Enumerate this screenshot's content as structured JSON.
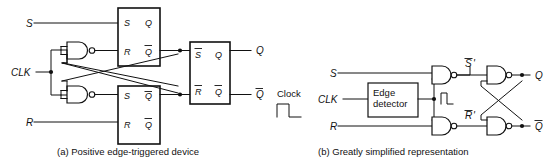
{
  "figure": {
    "panels": [
      {
        "id": "a",
        "caption": "(a)  Positive edge-triggered device",
        "inputs": [
          {
            "name": "input-S",
            "label": "S"
          },
          {
            "name": "input-CLK",
            "label": "CLK"
          },
          {
            "name": "input-R",
            "label": "R"
          }
        ],
        "outputs": [
          {
            "name": "output-Q",
            "label": "Q"
          },
          {
            "name": "output-Qbar",
            "label": "Q",
            "overbar": true
          }
        ],
        "latches": [
          {
            "name": "latch-top-left",
            "pins": {
              "s": "S",
              "q": "Q",
              "r": "R",
              "qbar": "Q"
            }
          },
          {
            "name": "latch-bottom-left",
            "pins": {
              "s": "S",
              "q": "Q",
              "r": "R",
              "qbar": "Q"
            }
          },
          {
            "name": "latch-right",
            "pins": {
              "s": "S",
              "q": "Q",
              "r": "R",
              "qbar": "Q"
            }
          }
        ],
        "gates": [
          {
            "name": "nand-gate-top",
            "type": "NAND",
            "inputs": 2
          },
          {
            "name": "nand-gate-bottom",
            "type": "NAND",
            "inputs": 2
          }
        ]
      },
      {
        "id": "b",
        "caption": "(b) Greatly simplified representation",
        "clock_legend": "Clock",
        "inputs": [
          {
            "name": "input-S",
            "label": "S"
          },
          {
            "name": "input-CLK",
            "label": "CLK"
          },
          {
            "name": "input-R",
            "label": "R"
          }
        ],
        "block": {
          "name": "edge-detector-block",
          "line1": "Edge",
          "line2": "detector"
        },
        "internal_signals": [
          {
            "name": "signal-s-prime",
            "label": "S",
            "overbar": true,
            "prime": "'"
          },
          {
            "name": "signal-r-prime",
            "label": "R",
            "overbar": true,
            "prime": "'"
          }
        ],
        "outputs": [
          {
            "name": "output-Q",
            "label": "Q"
          },
          {
            "name": "output-Qbar",
            "label": "Q",
            "overbar": true
          }
        ],
        "gates": [
          {
            "name": "nand-gate-set",
            "type": "NAND",
            "inputs": 2
          },
          {
            "name": "nand-gate-reset",
            "type": "NAND",
            "inputs": 2
          },
          {
            "name": "nand-gate-cross-top",
            "type": "NAND",
            "inputs": 2
          },
          {
            "name": "nand-gate-cross-bottom",
            "type": "NAND",
            "inputs": 2
          }
        ]
      }
    ],
    "colors": {
      "ink": "#111111",
      "paper": "#ffffff"
    }
  }
}
